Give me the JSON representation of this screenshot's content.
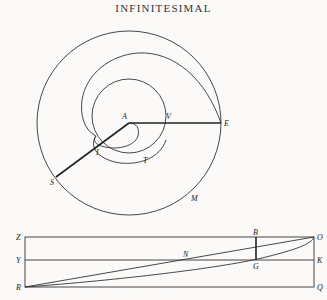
{
  "header": {
    "title": "INFINITESIMAL"
  },
  "figure_spiral": {
    "labels": {
      "A": "A",
      "V": "V",
      "E": "E",
      "I": "I",
      "T": "T",
      "S": "S",
      "M": "M"
    }
  },
  "figure_rectangle": {
    "labels": {
      "Z": "Z",
      "Y": "Y",
      "R": "R",
      "B": "B",
      "N": "N",
      "G": "G",
      "O": "O",
      "K": "K",
      "Q": "Q"
    }
  },
  "footer": {
    "bleed_text": "· · · · · · · · · · · · · · · ·"
  }
}
